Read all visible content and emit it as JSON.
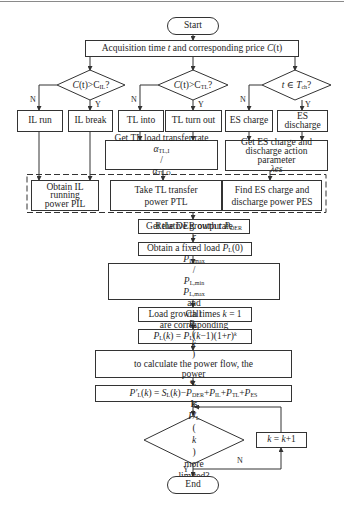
{
  "diagram": {
    "type": "flowchart",
    "nodes": {
      "start": "Start",
      "acquisition": "Acquisition time t and corresponding price C(t)",
      "decision_il": "C(t)>C_IL?",
      "decision_tl": "C(t)>C_TL?",
      "decision_es": "t ∈ T_ch?",
      "il_run": "IL run",
      "il_break": "IL break",
      "tl_into": "TL into",
      "tl_turn_out": "TL turn out",
      "es_charge": "ES charge",
      "es_discharge": "ES discharge",
      "get_tl_rate": "Get TL load transfer rate α_TL,I/α_TL,O",
      "get_es_param": "Get ES charge and discharge action parameter λes",
      "obtain_il": "Obtain IL running power PIL",
      "take_tl": "Take TL transfer power PTL",
      "find_es": "Find ES charge and discharge power PES",
      "der_output": "Get the DER output P_DER",
      "fixed_load": "Obtain a fixed load P_L(0)",
      "growth_rate": "Relative growth rate r = P_L,max/P_L,min; P_L,max and P_L,min are corresponding node load the most value",
      "growth_times": "Load growth times k = 1",
      "pl_k": "P_L(k) = P_L(k−1)(1+r)^k",
      "call_flow": "Call P_L(k) to calculate the power flow, the power S_L(k)",
      "p_prime": "P'_L(k) = S_L(k) − P_DER + P_IL + P_TL + P_ES",
      "decision_limit": "Is P'_L(k) more limited?",
      "increment": "k = k+1",
      "end": "End"
    },
    "edge_labels": {
      "no": "N",
      "yes": "Y"
    }
  },
  "text": {
    "start": "Start",
    "acq_a": "Acquisition time ",
    "acq_t": "t",
    "acq_b": " and corresponding price ",
    "acq_c": "C",
    "acq_ct": "(t)",
    "d_c": "C",
    "d_t": "(t)",
    "d_gt": ">C",
    "d_il_sub": "IL",
    "d_tl_sub": "TL",
    "d_q": "?",
    "d_es_t": "t",
    "d_es_in": " ∈ ",
    "d_es_T": "T",
    "d_es_sub": "ch",
    "n": "N",
    "y": "Y",
    "il_run": "IL run",
    "il_break": "IL break",
    "tl_into": "TL into",
    "tl_turn_out": "TL turn out",
    "es_charge": "ES charge",
    "es_discharge_1": "ES",
    "es_discharge_2": "discharge",
    "tl_rate_1": "Get TL load transfer rate",
    "alpha": "α",
    "tl_i": "TL,I",
    "slash": "/",
    "tl_o": "TL,O",
    "es_param_1": "Get ES charge and",
    "es_param_2": "discharge action",
    "es_param_3a": "parameter ",
    "es_param_3b": "λes",
    "obtain_il_1": "Obtain IL",
    "obtain_il_2": "running",
    "obtain_il_3": "power PIL",
    "take_tl_1": "Take TL transfer",
    "take_tl_2": "power PTL",
    "find_es_1": "Find ES charge and",
    "find_es_2": "discharge power PES",
    "der_a": "Get the DER output ",
    "P": "P",
    "der_sub": "DER",
    "fixed_a": "Obtain a fixed load ",
    "L": "L",
    "zero": "(0)",
    "gr_a": "Relative growth rate ",
    "r": "r",
    "eq": " = ",
    "lmax": "L,max",
    "lmin": "L,min",
    "gr_and": " and ",
    "gr_b": " are corresponding",
    "gr_c": "node load the most value",
    "gt_a": "Load growth times ",
    "k": "k",
    "gt_b": " = 1",
    "pk_open": "(",
    "pk_close": ")",
    "pk_mid": "(",
    "pk_km1": "k",
    "pk_tail": "−1)(1+",
    "pk_tail2": ")",
    "call_a": "Call ",
    "call_b": " to calculate the power flow, the",
    "call_c": "power ",
    "pp_prime": "P'",
    "minus": "−",
    "plus": "+",
    "il": "IL",
    "tl": "TL",
    "es": "ES",
    "lim_a": "Is ",
    "lim_b": "more",
    "lim_c": "limited?",
    "inc_a": " = ",
    "inc_b": "+1",
    "end": "End",
    "S": "S"
  },
  "colors": {
    "line": "#333333",
    "background": "#ffffff",
    "top_rule": "#8a8a8a"
  }
}
